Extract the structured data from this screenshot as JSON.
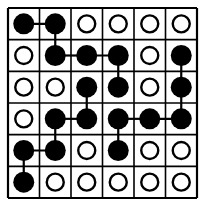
{
  "puzzle": {
    "rows": 6,
    "cols": 6,
    "grid": [
      [
        "F",
        "F",
        "O",
        "O",
        "O",
        "O"
      ],
      [
        "O",
        "F",
        "F",
        "F",
        "O",
        "F"
      ],
      [
        "O",
        "O",
        "F",
        "F",
        "O",
        "F"
      ],
      [
        "O",
        "F",
        "F",
        "F",
        "F",
        "F"
      ],
      [
        "F",
        "F",
        "O",
        "F",
        "O",
        "O"
      ],
      [
        "F",
        "O",
        "O",
        "O",
        "O",
        "O"
      ]
    ],
    "legend": {
      "F": "filled-dot",
      "O": "empty-circle"
    },
    "connections": [
      [
        [
          0,
          0
        ],
        [
          0,
          1
        ]
      ],
      [
        [
          0,
          1
        ],
        [
          1,
          1
        ]
      ],
      [
        [
          1,
          1
        ],
        [
          1,
          2
        ]
      ],
      [
        [
          1,
          2
        ],
        [
          1,
          3
        ]
      ],
      [
        [
          1,
          3
        ],
        [
          2,
          3
        ]
      ],
      [
        [
          2,
          2
        ],
        [
          3,
          2
        ]
      ],
      [
        [
          3,
          1
        ],
        [
          3,
          2
        ]
      ],
      [
        [
          3,
          1
        ],
        [
          4,
          1
        ]
      ],
      [
        [
          4,
          0
        ],
        [
          4,
          1
        ]
      ],
      [
        [
          4,
          0
        ],
        [
          5,
          0
        ]
      ],
      [
        [
          3,
          3
        ],
        [
          3,
          4
        ]
      ],
      [
        [
          3,
          4
        ],
        [
          3,
          5
        ]
      ],
      [
        [
          3,
          3
        ],
        [
          4,
          3
        ]
      ],
      [
        [
          2,
          5
        ],
        [
          3,
          5
        ]
      ],
      [
        [
          1,
          5
        ],
        [
          2,
          5
        ]
      ]
    ],
    "colors": {
      "ink": "#000000",
      "background": "#ffffff"
    }
  }
}
